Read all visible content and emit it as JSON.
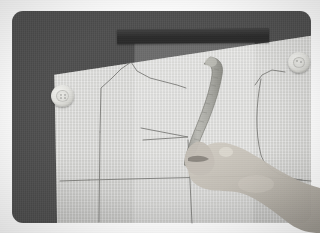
{
  "photo": {
    "caption": "",
    "subject": "hand using a curved pattern ruler to draft a bodice sewing pattern on paper",
    "scene": "sewing pattern drafting on a dark cutting board",
    "colors": {
      "page_background": "#ffffff",
      "board": "#4c4c4c",
      "board_top_bar": "#2b2b2b",
      "paper": "#d6d6d3",
      "pattern_line": "#6e6e6b",
      "button": "#e3e3df",
      "ruler": "#a9a9a4",
      "skin": "#bdb8b0"
    },
    "frame": {
      "border_radius": 11,
      "inset_left": 12,
      "inset_top": 11,
      "width": 299,
      "height": 212
    }
  },
  "objects": {
    "board": {
      "label": "cutting board"
    },
    "top_bar": {
      "label": "dark board edge"
    },
    "paper": {
      "label": "pattern paper sheet"
    },
    "overlay_sheet": {
      "label": "translucent overlay sheet"
    },
    "button_left": {
      "label": "sewing button"
    },
    "button_right": {
      "label": "sewing button"
    },
    "curve_ruler": {
      "label": "curved pattern ruler"
    },
    "hand": {
      "label": "hand"
    }
  },
  "pattern": {
    "name": "bodice front pattern draft",
    "shapes": [
      {
        "name": "shoulder-and-neckline-outline",
        "points": "100,132 101,88 112,78 121,69 131,62 137,71 150,78 177,85 186,88"
      },
      {
        "name": "bust-dart",
        "points": "141,128 188,137 143,140"
      },
      {
        "name": "centre-front-vertical",
        "points": "100,132 99,222"
      },
      {
        "name": "waistline-horizontal",
        "points": "89,180 252,176"
      },
      {
        "name": "side-seam-vertical",
        "points": "188,140 192,223"
      },
      {
        "name": "armhole-curve",
        "points": "255,85 262,75 272,70 285,72"
      },
      {
        "name": "side-curve-right",
        "points": "261,79 257,110 258,136 264,162 279,175 300,180"
      },
      {
        "name": "lower-right-edge",
        "points": "252,176 311,181"
      }
    ]
  }
}
